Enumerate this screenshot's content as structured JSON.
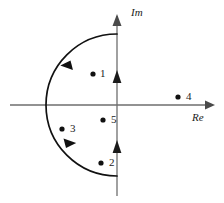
{
  "figure": {
    "axes": {
      "imaginary_label": "Im",
      "real_label": "Re",
      "origin": {
        "x": 117,
        "y": 105
      }
    },
    "contour": {
      "type": "semicircle",
      "radius": 71,
      "center": {
        "x": 117,
        "y": 105
      },
      "orientation": "counterclockwise",
      "arc_start": {
        "x": 117,
        "y": 34
      },
      "arc_end": {
        "x": 117,
        "y": 176
      },
      "direction_arrows": [
        {
          "name": "arc-arrow-upper-left",
          "x": 66,
          "y": 65,
          "angle": -48
        },
        {
          "name": "arc-arrow-lower-left",
          "x": 68,
          "y": 152,
          "angle": 228
        },
        {
          "name": "axis-arrow-upper",
          "x": 117,
          "y": 74
        },
        {
          "name": "axis-arrow-lower",
          "x": 117,
          "y": 144
        }
      ]
    },
    "points": [
      {
        "label": "1",
        "x": 93,
        "y": 74,
        "inside": true
      },
      {
        "label": "2",
        "x": 101,
        "y": 163,
        "inside": true
      },
      {
        "label": "3",
        "x": 62,
        "y": 129,
        "inside": true
      },
      {
        "label": "4",
        "x": 178,
        "y": 97,
        "inside": false
      },
      {
        "label": "5",
        "x": 103,
        "y": 120,
        "inside": true
      }
    ],
    "colors": {
      "axis": "#6e6e6e",
      "contour": "#111111",
      "point": "#111111",
      "text": "#1a1a1a",
      "background": "#ffffff"
    }
  }
}
